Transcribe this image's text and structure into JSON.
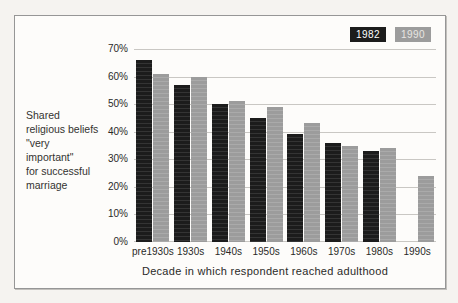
{
  "figure": {
    "page_background": "#f5f3f0",
    "background": "#fdfcfa",
    "border_color": "#969696"
  },
  "side_caption": {
    "lines": [
      "Shared",
      "religious beliefs",
      "\"very",
      "important\"",
      "for successful",
      "marriage"
    ]
  },
  "chart_data": {
    "type": "bar",
    "title": "",
    "categories": [
      "pre1930s",
      "1930s",
      "1940s",
      "1950s",
      "1960s",
      "1970s",
      "1980s",
      "1990s"
    ],
    "series": [
      {
        "name": "1982",
        "color": "#1c1c1c",
        "streak_color": "#343434",
        "label_color": "#ffffff",
        "values": [
          66,
          57,
          50,
          45,
          39,
          36,
          33,
          null
        ]
      },
      {
        "name": "1990",
        "color": "#9c9c9c",
        "streak_color": "#aaaaaa",
        "label_color": "#e8e6e2",
        "values": [
          61,
          60,
          51,
          49,
          43,
          35,
          34,
          24
        ]
      }
    ],
    "xlabel": "Decade in which respondent reached adulthood",
    "ylabel_caption": "Shared religious beliefs \"very important\" for successful marriage",
    "ylim": [
      0,
      70
    ],
    "ytick_step": 10,
    "ytick_labels": [
      "0%",
      "10%",
      "20%",
      "30%",
      "40%",
      "50%",
      "60%",
      "70%"
    ],
    "grid": true,
    "gridline_color": "#c9c7c3",
    "legend_position": "top-right"
  }
}
